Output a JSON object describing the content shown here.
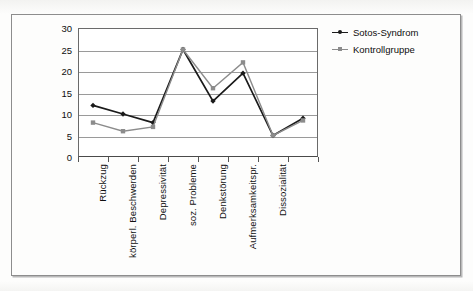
{
  "figure": {
    "background_color": "#fdfdfc",
    "frame_color": "#8d8d8d"
  },
  "legend": {
    "position": "top-right",
    "entries": [
      {
        "label": "Sotos-Syndrom",
        "color": "#1a1a1a",
        "marker": "diamond-marker-icon"
      },
      {
        "label": "Kontrollgruppe",
        "color": "#8c8c8c",
        "marker": "square-marker-icon"
      }
    ]
  },
  "chart_data": {
    "type": "line",
    "title": "",
    "xlabel": "",
    "ylabel": "",
    "ylim": [
      0,
      30
    ],
    "ytick_step": 5,
    "yticks": [
      0,
      5,
      10,
      15,
      20,
      25,
      30
    ],
    "grid": true,
    "grid_axis": "y",
    "legend_position": "top-right",
    "categories": [
      "Rückzug",
      "körperl. Beschwerden",
      "Depressivität",
      "soz. Probleme",
      "Denkstörung",
      "Aufmerksamkeitspr.",
      "Dissozialität",
      ""
    ],
    "series": [
      {
        "name": "Sotos-Syndrom",
        "color": "#1a1a1a",
        "marker": "diamond",
        "values": [
          12,
          10,
          8,
          25,
          13,
          19.5,
          5,
          9
        ]
      },
      {
        "name": "Kontrollgruppe",
        "color": "#8c8c8c",
        "marker": "square",
        "values": [
          8,
          6,
          7,
          25,
          16,
          22,
          5,
          8.5
        ]
      }
    ]
  }
}
